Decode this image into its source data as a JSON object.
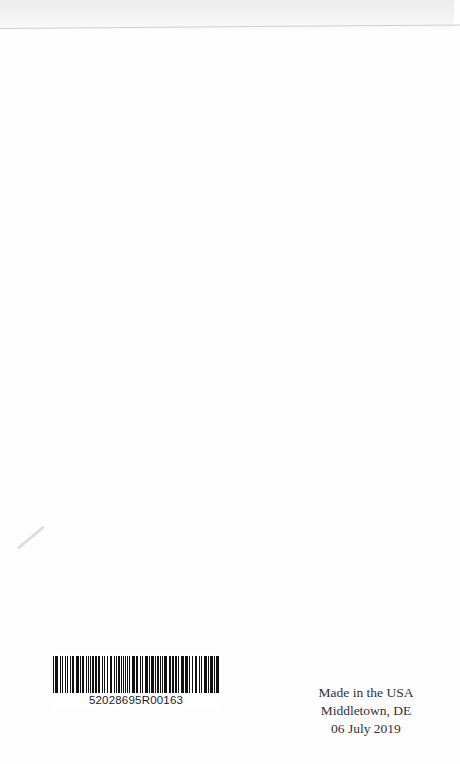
{
  "page": {
    "type": "book back page",
    "background": "#fdfdfd"
  },
  "barcode": {
    "number": "52028695R00163",
    "bar_color": "#111111"
  },
  "imprint": {
    "lines": [
      "Made in the USA",
      "Middletown, DE",
      "06 July 2019"
    ]
  }
}
